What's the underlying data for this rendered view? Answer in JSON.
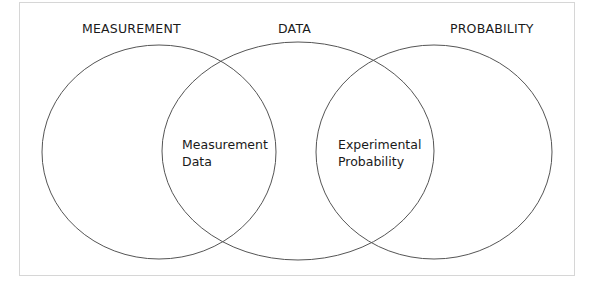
{
  "diagram": {
    "type": "venn",
    "sets": [
      {
        "id": "measurement",
        "label": "MEASUREMENT"
      },
      {
        "id": "data",
        "label": "DATA"
      },
      {
        "id": "probability",
        "label": "PROBABILITY"
      }
    ],
    "intersections": [
      {
        "sets": [
          "measurement",
          "data"
        ],
        "lines": [
          "Measurement",
          "Data"
        ]
      },
      {
        "sets": [
          "data",
          "probability"
        ],
        "lines": [
          "Experimental",
          "Probability"
        ]
      }
    ],
    "colors": {
      "stroke": "#555555",
      "frame": "#d6d6d6",
      "text": "#1a1a1a"
    }
  }
}
